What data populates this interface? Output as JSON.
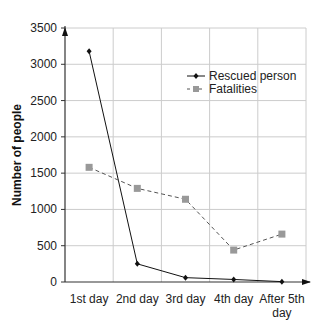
{
  "chart_data": {
    "type": "line",
    "title": "",
    "xlabel": "",
    "ylabel": "Number of people",
    "categories": [
      "1st day",
      "2nd day",
      "3rd day",
      "4th day",
      "After 5th day"
    ],
    "category_lines": [
      [
        "1st day"
      ],
      [
        "2nd day"
      ],
      [
        "3rd day"
      ],
      [
        "4th day"
      ],
      [
        "After 5th",
        "day"
      ]
    ],
    "ylim": [
      0,
      3500
    ],
    "yticks": [
      0,
      500,
      1000,
      1500,
      2000,
      2500,
      3000,
      3500
    ],
    "grid": true,
    "legend_position": "upper right (inside)",
    "series": [
      {
        "name": "Rescued person",
        "style": "solid",
        "marker": "diamond",
        "color": "#111111",
        "values": [
          3180,
          250,
          60,
          35,
          5
        ]
      },
      {
        "name": "Fatalities",
        "style": "dashed",
        "marker": "square",
        "color": "#999999",
        "line_color": "#555555",
        "values": [
          1580,
          1290,
          1140,
          440,
          660
        ]
      }
    ]
  },
  "colors": {
    "grid": "#cccccc",
    "axis": "#333333"
  }
}
